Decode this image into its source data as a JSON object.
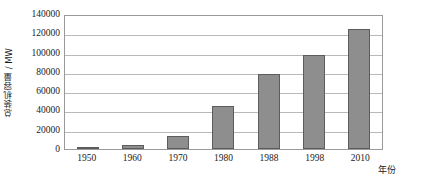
{
  "chart_data": {
    "type": "bar",
    "title": "",
    "subtitle": "",
    "xlabel": "年份",
    "ylabel": "总装机容量 / MW",
    "categories": [
      "1950",
      "1960",
      "1970",
      "1980",
      "1988",
      "1998",
      "2010"
    ],
    "values": [
      1850,
      4000,
      13500,
      45000,
      78000,
      98000,
      124000
    ],
    "series": [
      {
        "name": "总装机容量",
        "values": [
          1850,
          4000,
          13500,
          45000,
          78000,
          98000,
          124000
        ]
      }
    ],
    "ylim": [
      0,
      140000
    ],
    "ytick_labels": [
      "0",
      "20000",
      "40000",
      "60000",
      "80000",
      "100000",
      "120000",
      "140000"
    ],
    "ytick_values": [
      0,
      20000,
      40000,
      60000,
      80000,
      100000,
      120000,
      140000
    ],
    "ytick_step": 20000,
    "grid": true,
    "grid_axis": "y",
    "legend": false,
    "legend_position": "none",
    "bar_fill_color": "#8e8e8e",
    "bar_border_color": "#5c5c5c",
    "gridline_color": "#b9b9b9",
    "plot_border_color": "#9a9a9a",
    "background_color": "#ffffff"
  }
}
